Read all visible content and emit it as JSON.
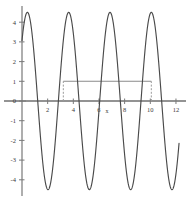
{
  "chart_data": {
    "type": "line",
    "title": "",
    "subtitle": "",
    "xlabel": "x",
    "ylabel": "",
    "xlim": [
      -0.35,
      12.6
    ],
    "ylim": [
      -4.9,
      4.9
    ],
    "grid": false,
    "legend": null,
    "background": "#ffffff",
    "axis_color": "#7a7a7a",
    "curve_color": "#4a4a4a",
    "marker_color": "#8a8a8a",
    "xticks": [
      2,
      4,
      6,
      8,
      10,
      12
    ],
    "xtick_labels": [
      "2",
      "4",
      "6",
      "8",
      "10",
      "12"
    ],
    "yticks": [
      4,
      3,
      2,
      1,
      0,
      -1,
      -2,
      -3,
      -4
    ],
    "ytick_labels": [
      "4",
      "3",
      "2",
      "1",
      "0",
      "-1",
      "-2",
      "-3",
      "-4"
    ],
    "series": [
      {
        "name": "sinusoid",
        "type": "line",
        "color": "#4a4a4a",
        "amplitude": 4.5,
        "period": 3.22,
        "phase_peak_x": 0.42,
        "x_start": 0.0,
        "x_end": 12.25,
        "y_start": 3.05,
        "y_end": -2.05,
        "peaks_x": [
          0.42,
          3.64,
          6.86,
          10.08
        ],
        "peaks_y": [
          4.5,
          4.5,
          4.5,
          4.5
        ],
        "troughs_x": [
          2.03,
          5.25,
          8.47,
          11.69
        ],
        "troughs_y": [
          -4.5,
          -4.5,
          -4.5,
          -4.5
        ]
      }
    ],
    "annotations": [
      {
        "name": "period-measure-line",
        "type": "horizontal-segment",
        "y": 1.0,
        "x_from": 3.22,
        "x_to": 10.08,
        "color": "#8a8a8a"
      },
      {
        "name": "left-drop-line",
        "type": "vertical-dashed",
        "x": 3.22,
        "y_from": 0.0,
        "y_to": 1.0,
        "color": "#9a9a9a"
      },
      {
        "name": "right-drop-line",
        "type": "vertical-dashed",
        "x": 10.08,
        "y_from": 0.0,
        "y_to": 1.0,
        "color": "#9a9a9a"
      }
    ]
  },
  "axis": {
    "x_label": "x",
    "y_label": ""
  }
}
